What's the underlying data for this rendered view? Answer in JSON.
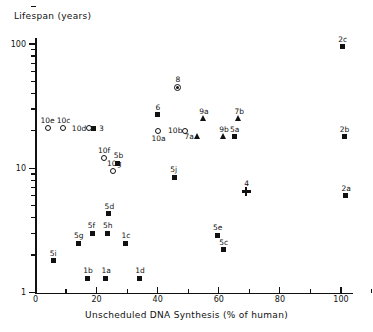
{
  "chart_data": {
    "type": "scatter",
    "title": "",
    "ylabel": "Lifespan (years)",
    "xlabel": "Unscheduled DNA Synthesis (% of human)",
    "yscale": "log",
    "ylim": [
      1,
      200
    ],
    "xlim": [
      -2,
      112
    ],
    "grid": false,
    "legend": "none",
    "y_tick_labels": [
      "100",
      "10",
      "1"
    ],
    "y_tick_values": [
      100,
      10,
      1
    ],
    "x_tick_labels": [
      "0",
      "20",
      "40",
      "60",
      "80",
      "100"
    ],
    "x_tick_values": [
      0,
      20,
      40,
      60,
      80,
      100
    ],
    "points": [
      {
        "label": "2c",
        "x": 100.5,
        "y": 95,
        "marker": "square",
        "label_pos": "above"
      },
      {
        "label": "8",
        "x": 46.5,
        "y": 45,
        "marker": "circledot",
        "label_pos": "above"
      },
      {
        "label": "6",
        "x": 40.0,
        "y": 27,
        "marker": "square",
        "label_pos": "above"
      },
      {
        "label": "9a",
        "x": 55.0,
        "y": 25,
        "marker": "triangle",
        "label_pos": "above"
      },
      {
        "label": "7b",
        "x": 66.5,
        "y": 25,
        "marker": "triangle",
        "label_pos": "above"
      },
      {
        "label": "10e",
        "x": 4.0,
        "y": 21,
        "marker": "circle",
        "label_pos": "left-above"
      },
      {
        "label": "10c",
        "x": 9.0,
        "y": 21,
        "marker": "circle",
        "label_pos": "above"
      },
      {
        "label": "10d",
        "x": 17.5,
        "y": 21,
        "marker": "circle",
        "label_pos": "left"
      },
      {
        "label": "3",
        "x": 19.0,
        "y": 21,
        "marker": "square",
        "label_pos": "right"
      },
      {
        "label": "10b",
        "x": 49.0,
        "y": 20,
        "marker": "circle",
        "label_pos": "left"
      },
      {
        "label": "10a",
        "x": 40.0,
        "y": 20,
        "marker": "circle",
        "label_pos": "below"
      },
      {
        "label": "7a",
        "x": 53.0,
        "y": 18,
        "marker": "triangle",
        "label_pos": "left"
      },
      {
        "label": "9b",
        "x": 61.5,
        "y": 18,
        "marker": "triangle",
        "label_pos": "above"
      },
      {
        "label": "5a",
        "x": 65.0,
        "y": 18,
        "marker": "square",
        "label_pos": "above"
      },
      {
        "label": "2b",
        "x": 101.0,
        "y": 18,
        "marker": "square",
        "label_pos": "above"
      },
      {
        "label": "10f",
        "x": 22.5,
        "y": 12,
        "marker": "circle",
        "label_pos": "above"
      },
      {
        "label": "5b",
        "x": 27.0,
        "y": 11,
        "marker": "square",
        "label_pos": "above"
      },
      {
        "label": "10g",
        "x": 25.5,
        "y": 9.5,
        "marker": "circle",
        "label_pos": "above"
      },
      {
        "label": "5j",
        "x": 45.5,
        "y": 8.5,
        "marker": "square",
        "label_pos": "above"
      },
      {
        "label": "2a",
        "x": 101.5,
        "y": 6.0,
        "marker": "square",
        "label_pos": "above"
      },
      {
        "label": "4",
        "x": 69.0,
        "y": 6.5,
        "marker": "plus",
        "label_pos": "above"
      },
      {
        "label": "5d",
        "x": 24.0,
        "y": 4.3,
        "marker": "square",
        "label_pos": "above"
      },
      {
        "label": "5f",
        "x": 18.5,
        "y": 3.0,
        "marker": "square",
        "label_pos": "above"
      },
      {
        "label": "5h",
        "x": 23.5,
        "y": 3.0,
        "marker": "square",
        "label_pos": "above"
      },
      {
        "label": "5e",
        "x": 59.5,
        "y": 2.9,
        "marker": "square",
        "label_pos": "above"
      },
      {
        "label": "5g",
        "x": 14.0,
        "y": 2.5,
        "marker": "square",
        "label_pos": "above"
      },
      {
        "label": "1c",
        "x": 29.5,
        "y": 2.5,
        "marker": "square",
        "label_pos": "above"
      },
      {
        "label": "5c",
        "x": 61.5,
        "y": 2.2,
        "marker": "square",
        "label_pos": "above"
      },
      {
        "label": "5i",
        "x": 6.0,
        "y": 1.8,
        "marker": "square",
        "label_pos": "above"
      },
      {
        "label": "1b",
        "x": 17.0,
        "y": 1.3,
        "marker": "square",
        "label_pos": "above"
      },
      {
        "label": "1a",
        "x": 23.0,
        "y": 1.3,
        "marker": "square",
        "label_pos": "above"
      },
      {
        "label": "1d",
        "x": 34.0,
        "y": 1.3,
        "marker": "square",
        "label_pos": "above"
      }
    ]
  }
}
